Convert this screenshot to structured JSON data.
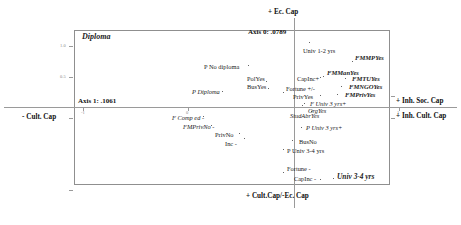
{
  "figure": {
    "type": "scatter",
    "frame": {
      "left": 74,
      "top": 30,
      "width": 316,
      "height": 155
    },
    "axis_captions": {
      "top": "+ Ec. Cap",
      "bottom": "+ Cult.Cap/-Ec. Cap",
      "left": "- Cult. Cap",
      "right_upper": "+ Inh. Soc. Cap",
      "right_lower": "+ Inh. Cult. Cap"
    },
    "axis_values": {
      "axis1": "Axis 1: .1061",
      "axis0": "Axis 0: .0789"
    },
    "corner_title": "Diploma",
    "tick_labels": [
      "1.0",
      "0.5",
      "-1",
      "0",
      "1"
    ]
  },
  "chart_data": {
    "type": "scatter",
    "title": "Diploma",
    "xlabel": "+ Cult.Cap/-Ec. Cap",
    "ylabel": "+ Ec. Cap",
    "grid": false,
    "legend": "none",
    "axis_inertia": {
      "axis_0": 0.0789,
      "axis_1": 0.1061
    },
    "quadrant_labels": {
      "top": "+ Ec. Cap",
      "bottom": "+ Cult.Cap/-Ec. Cap",
      "left": "- Cult. Cap",
      "right_upper": "+ Inh. Soc. Cap",
      "right_lower": "+ Inh. Cult. Cap"
    },
    "points": [
      {
        "label": "Univ 1-2 yrs",
        "style": "plain",
        "x": 303,
        "y": 48,
        "px": 309,
        "py": 42
      },
      {
        "label": "FMMPYes",
        "style": "active",
        "x": 355,
        "y": 55,
        "px": 352,
        "py": 61
      },
      {
        "label": "P No diploma",
        "style": "plain",
        "x": 204,
        "y": 64,
        "px": 248,
        "py": 65
      },
      {
        "label": "FMManYes",
        "style": "active",
        "x": 327,
        "y": 70,
        "px": 323,
        "py": 76
      },
      {
        "label": "FMTUYes",
        "style": "active",
        "x": 352,
        "y": 76,
        "px": 345,
        "py": 78
      },
      {
        "label": "PolYes",
        "style": "plain",
        "x": 247,
        "y": 76,
        "px": 266,
        "py": 81
      },
      {
        "label": "CapInc+",
        "style": "plain",
        "x": 297,
        "y": 76,
        "px": 320,
        "py": 77
      },
      {
        "label": "FMNGOYes",
        "style": "active",
        "x": 349,
        "y": 84,
        "px": 341,
        "py": 86
      },
      {
        "label": "BusYes",
        "style": "plain",
        "x": 247,
        "y": 84,
        "px": 268,
        "py": 88
      },
      {
        "label": "P Diploma",
        "style": "passive",
        "x": 192,
        "y": 89,
        "px": 222,
        "py": 91
      },
      {
        "label": "Fortune +/-",
        "style": "plain",
        "x": 286,
        "y": 86,
        "px": 283,
        "py": 92
      },
      {
        "label": "FMPrivYes",
        "style": "active",
        "x": 345,
        "y": 92,
        "px": 337,
        "py": 94
      },
      {
        "label": "PrivYes",
        "style": "plain",
        "x": 293,
        "y": 94,
        "px": 320,
        "py": 95
      },
      {
        "label": "F Univ 3 yrs+",
        "style": "passive",
        "x": 310,
        "y": 101,
        "px": 304,
        "py": 103
      },
      {
        "label": "OrgYes",
        "style": "passive",
        "x": 308,
        "y": 108,
        "px": 302,
        "py": 105
      },
      {
        "label": "StudAbrYes",
        "style": "passive",
        "x": 290,
        "y": 113,
        "px": 311,
        "py": 111
      },
      {
        "label": "F Comp ed -",
        "style": "passive",
        "x": 172,
        "y": 115,
        "px": 203,
        "py": 116
      },
      {
        "label": "FMPrivNo -",
        "style": "passive",
        "x": 183,
        "y": 124,
        "px": 211,
        "py": 125
      },
      {
        "label": "P Univ 3 yrs+",
        "style": "passive",
        "x": 306,
        "y": 125,
        "px": 301,
        "py": 127
      },
      {
        "label": "PrivNo",
        "style": "plain",
        "x": 215,
        "y": 132,
        "px": 239,
        "py": 133
      },
      {
        "label": "BusNo",
        "style": "plain",
        "x": 299,
        "y": 139,
        "px": 292,
        "py": 140
      },
      {
        "label": "Inc -",
        "style": "plain",
        "x": 225,
        "y": 141,
        "px": 244,
        "py": 138
      },
      {
        "label": "P Univ 3-4 yrs",
        "style": "plain",
        "x": 287,
        "y": 148,
        "px": 283,
        "py": 149
      },
      {
        "label": "Fortune -",
        "style": "plain",
        "x": 287,
        "y": 166,
        "px": 283,
        "py": 172
      },
      {
        "label": "Univ 3-4 yrs",
        "style": "big",
        "x": 337,
        "y": 173,
        "px": 333,
        "py": 178
      },
      {
        "label": "CapInc -",
        "style": "plain",
        "x": 294,
        "y": 176,
        "px": 320,
        "py": 179
      }
    ]
  }
}
